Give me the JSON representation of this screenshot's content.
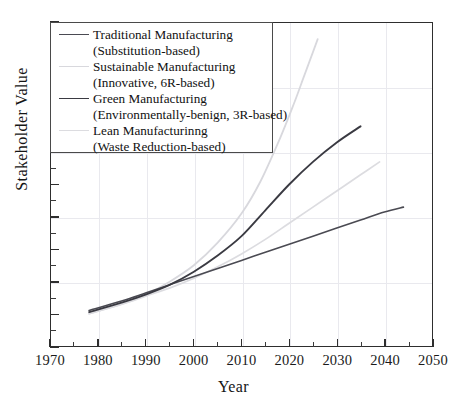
{
  "chart_data": {
    "type": "line",
    "title": "",
    "xlabel": "Year",
    "ylabel": "Stakeholder Value",
    "xlim": [
      1970,
      2050
    ],
    "ylim": [
      0,
      100
    ],
    "xticks": [
      1970,
      1980,
      1990,
      2000,
      2010,
      2020,
      2030,
      2040,
      2050
    ],
    "xticklabels": [
      "1970",
      "1980",
      "1990",
      "2000",
      "2010",
      "2020",
      "2030",
      "2040",
      "2050"
    ],
    "yticks": [],
    "yticklabels": [],
    "grid": true,
    "legend_position": "upper-left",
    "series": [
      {
        "name": "Traditional Manufacturing (Substitution-based)",
        "label_line1": "Traditional Manufacturing",
        "label_line2": "(Substitution-based)",
        "color": "#4a4a52",
        "width": 1.6,
        "x": [
          1978,
          1985,
          1990,
          1995,
          2000,
          2005,
          2010,
          2015,
          2020,
          2025,
          2030,
          2035,
          2040,
          2044
        ],
        "y": [
          11,
          14,
          16.5,
          19,
          21.5,
          24,
          26.5,
          29,
          31.5,
          34,
          36.5,
          39,
          41.5,
          43
        ]
      },
      {
        "name": "Sustainable Manufacturing (Innovative, 6R-based)",
        "label_line1": "Sustainable Manufacturing",
        "label_line2": "(Innovative, 6R-based)",
        "color": "#d8d8dd",
        "width": 1.8,
        "x": [
          1978,
          1985,
          1990,
          1995,
          2000,
          2005,
          2010,
          2014,
          2018,
          2021,
          2023,
          2025,
          2026
        ],
        "y": [
          10,
          13,
          16,
          20,
          25,
          32,
          41,
          51,
          64,
          75,
          83,
          91,
          95
        ]
      },
      {
        "name": "Green Manufacturing (Environmentally-benign, 3R-based)",
        "label_line1": "Green Manufacturing",
        "label_line2": "(Environmentally-benign, 3R-based)",
        "color": "#3a3a42",
        "width": 1.9,
        "x": [
          1978,
          1985,
          1990,
          1995,
          2000,
          2005,
          2010,
          2015,
          2020,
          2025,
          2030,
          2035
        ],
        "y": [
          10.5,
          13.5,
          16,
          19,
          23,
          28,
          34,
          42,
          50,
          57,
          63,
          68
        ]
      },
      {
        "name": "Lean Manufacturinng (Waste Reduction-based)",
        "label_line1": "Lean Manufacturinng",
        "label_line2": "(Waste Reduction-based)",
        "color": "#dcdce0",
        "width": 1.7,
        "x": [
          1978,
          1985,
          1990,
          1995,
          2000,
          2005,
          2010,
          2015,
          2020,
          2025,
          2030,
          2035,
          2039
        ],
        "y": [
          10,
          13,
          15.5,
          18,
          21,
          24.5,
          28.5,
          33,
          38,
          43,
          48,
          53,
          57
        ]
      }
    ]
  },
  "axes": {
    "x_title": "Year",
    "y_title": "Stakeholder Value"
  }
}
